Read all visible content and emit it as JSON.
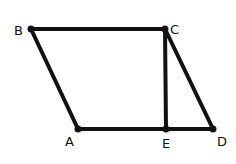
{
  "diagram": {
    "title": "",
    "points": [
      {
        "id": "B",
        "label": "B",
        "x": 31,
        "y": 29,
        "lx": 14,
        "ly": 35
      },
      {
        "id": "C",
        "label": "C",
        "x": 165,
        "y": 29,
        "lx": 170,
        "ly": 34
      },
      {
        "id": "A",
        "label": "A",
        "x": 78,
        "y": 129,
        "lx": 65,
        "ly": 146
      },
      {
        "id": "E",
        "label": "E",
        "x": 166,
        "y": 129,
        "lx": 162,
        "ly": 148
      },
      {
        "id": "D",
        "label": "D",
        "x": 213,
        "y": 129,
        "lx": 217,
        "ly": 146
      }
    ],
    "segments": [
      [
        "B",
        "C"
      ],
      [
        "B",
        "A"
      ],
      [
        "A",
        "D"
      ],
      [
        "C",
        "D"
      ],
      [
        "C",
        "E"
      ]
    ],
    "stroke_color": "#111111"
  }
}
